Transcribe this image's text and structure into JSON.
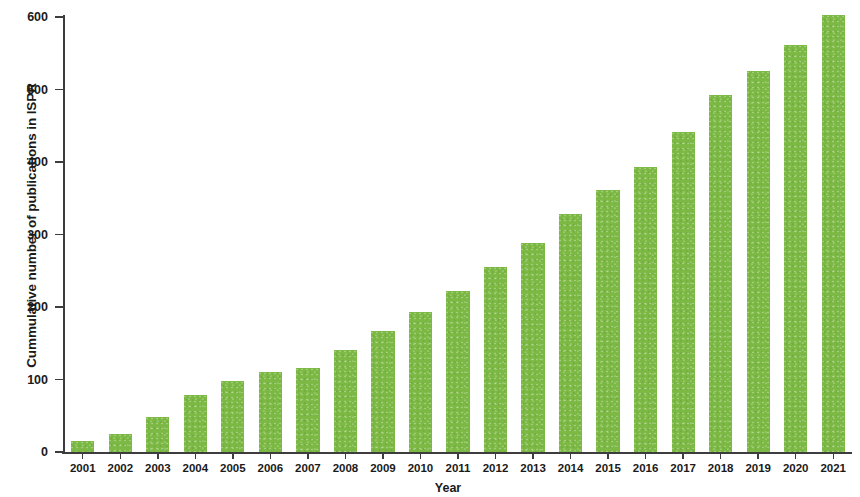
{
  "chart_data": {
    "type": "bar",
    "title": "",
    "subtitle": "",
    "xlabel": "Year",
    "ylabel": "Cummulative number of publications in ISPR",
    "categories": [
      "2001",
      "2002",
      "2003",
      "2004",
      "2005",
      "2006",
      "2007",
      "2008",
      "2009",
      "2010",
      "2011",
      "2012",
      "2013",
      "2014",
      "2015",
      "2016",
      "2017",
      "2018",
      "2019",
      "2020",
      "2021"
    ],
    "values": [
      15,
      25,
      48,
      78,
      98,
      110,
      116,
      141,
      167,
      193,
      222,
      255,
      288,
      328,
      361,
      393,
      441,
      492,
      525,
      561,
      603
    ],
    "series": [
      {
        "name": "Cummulative number of publications in ISPR",
        "values": [
          15,
          25,
          48,
          78,
          98,
          110,
          116,
          141,
          167,
          193,
          222,
          255,
          288,
          328,
          361,
          393,
          441,
          492,
          525,
          561,
          603
        ]
      }
    ],
    "ylim": [
      0,
      620
    ],
    "yticks": [
      0,
      100,
      200,
      300,
      400,
      500,
      600
    ],
    "ytick_labels": [
      "0",
      "100",
      "200",
      "300",
      "400",
      "500",
      "600"
    ],
    "grid": false,
    "legend": false,
    "legend_position": "none",
    "bar_color": "#7cb944",
    "axis_color": "#3d3d3d",
    "text_color": "#1a1a1a",
    "background": "#ffffff"
  }
}
